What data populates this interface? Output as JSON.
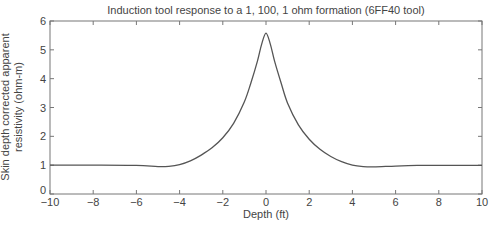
{
  "chart_data": {
    "type": "line",
    "title": "Induction tool response to a 1, 100, 1 ohm formation (6FF40 tool)",
    "xlabel": "Depth (ft)",
    "ylabel_lines": [
      "Skin depth corrected apparent",
      "resistivity (ohm-m)"
    ],
    "xlim": [
      -10,
      10
    ],
    "ylim": [
      0,
      6
    ],
    "xticks": [
      -10,
      -8,
      -6,
      -4,
      -2,
      0,
      2,
      4,
      6,
      8,
      10
    ],
    "xtick_labels": [
      "−10",
      "−8",
      "−6",
      "−4",
      "−2",
      "0",
      "2",
      "4",
      "6",
      "8",
      "10"
    ],
    "yticks": [
      0,
      1,
      2,
      3,
      4,
      5,
      6
    ],
    "ytick_labels": [
      "0",
      "1",
      "2",
      "3",
      "4",
      "5",
      "6"
    ],
    "grid": false,
    "legend": null,
    "series": [
      {
        "name": "Apparent resistivity",
        "color": "#555555",
        "x": [
          -10,
          -8,
          -6,
          -5,
          -4.5,
          -4,
          -3.5,
          -3,
          -2.5,
          -2,
          -1.5,
          -1,
          -0.7,
          -0.4,
          -0.2,
          0,
          0.2,
          0.4,
          0.7,
          1,
          1.5,
          2,
          2.5,
          3,
          3.5,
          4,
          4.5,
          5,
          6,
          7,
          8,
          10
        ],
        "y": [
          1.0,
          1.0,
          0.99,
          0.95,
          0.96,
          1.02,
          1.15,
          1.35,
          1.6,
          1.95,
          2.45,
          3.2,
          3.85,
          4.6,
          5.2,
          5.58,
          5.2,
          4.6,
          3.85,
          3.15,
          2.4,
          1.9,
          1.55,
          1.3,
          1.12,
          1.0,
          0.95,
          0.94,
          0.97,
          0.99,
          0.99,
          0.99
        ]
      }
    ]
  }
}
